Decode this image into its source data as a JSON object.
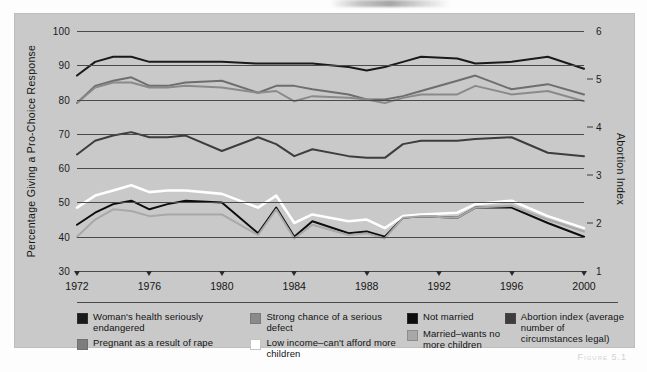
{
  "figure": {
    "caption": "Figure 5.1",
    "background_color": "#c9c9c9"
  },
  "chart_data": {
    "type": "line",
    "title": "",
    "xlabel": "",
    "ylabel": "Percentage  Giving a Pro-Choice Response",
    "y2label": "Abortion Index",
    "grid": true,
    "legend_position": "bottom",
    "xlim": [
      1972,
      2000
    ],
    "ylim": [
      30,
      100
    ],
    "y2lim": [
      1,
      6
    ],
    "yticks": [
      30,
      40,
      50,
      60,
      70,
      80,
      90,
      100
    ],
    "ytick_labels": [
      "30",
      "40",
      "50",
      "60",
      "70",
      "80",
      "90",
      "100"
    ],
    "y2ticks": [
      1,
      2,
      3,
      4,
      5,
      6
    ],
    "y2tick_labels": [
      "1",
      "2",
      "3",
      "4",
      "5",
      "6"
    ],
    "xticks": [
      1972,
      1976,
      1980,
      1984,
      1988,
      1992,
      1996,
      2000
    ],
    "xtick_labels": [
      "1972",
      "1976",
      "1980",
      "1984",
      "1988",
      "1992",
      "1996",
      "2000"
    ],
    "x": [
      1972,
      1973,
      1974,
      1975,
      1976,
      1977,
      1978,
      1980,
      1982,
      1983,
      1984,
      1985,
      1987,
      1988,
      1989,
      1990,
      1991,
      1993,
      1994,
      1996,
      1998,
      2000
    ],
    "series": [
      {
        "name": "Woman's health seriously endangered",
        "color": "#1a1a1a",
        "axis": "left",
        "values": [
          87,
          91,
          92.5,
          92.5,
          91,
          91,
          91,
          91,
          90.5,
          90.5,
          90.5,
          90.5,
          89.5,
          88.5,
          89.5,
          91,
          92.5,
          92,
          90.5,
          91,
          92.5,
          89
        ]
      },
      {
        "name": "Pregnant as a result of rape",
        "color": "#6e6e6e",
        "axis": "left",
        "values": [
          79,
          84,
          85.5,
          86.5,
          84,
          84,
          85,
          85.5,
          82,
          84,
          84,
          83,
          81.5,
          80,
          80,
          81,
          82.5,
          85.5,
          87,
          83,
          84.5,
          81.5
        ]
      },
      {
        "name": "Strong chance of a serious defect",
        "color": "#8a8a8a",
        "axis": "left",
        "values": [
          79,
          83.5,
          85,
          85,
          83.5,
          83.5,
          84,
          83.5,
          82,
          82.5,
          79.5,
          81,
          80.5,
          80,
          79,
          80.5,
          81.5,
          81.5,
          84,
          81.5,
          82.5,
          79.5
        ]
      },
      {
        "name": "Not married",
        "color": "#0d0d0d",
        "axis": "left",
        "values": [
          43.5,
          47,
          49.5,
          50.5,
          48,
          49.5,
          50.5,
          50,
          41,
          48.5,
          40,
          44.5,
          41,
          41.5,
          40,
          45.5,
          46,
          45.5,
          48.5,
          48.5,
          44,
          40
        ]
      },
      {
        "name": "Low income–can't afford more children",
        "color": "#ffffff",
        "axis": "left",
        "values": [
          48.5,
          52,
          53.5,
          55,
          53,
          53.5,
          53.5,
          52.5,
          48.5,
          52,
          44,
          46.5,
          44.5,
          45,
          42.5,
          46,
          46.5,
          47,
          49.5,
          50.5,
          46,
          42.5
        ]
      },
      {
        "name": "Married–wants no more children",
        "color": "#a8a8a8",
        "axis": "left",
        "values": [
          40,
          45,
          48,
          47.5,
          46,
          46.5,
          46.5,
          46.5,
          40.5,
          48,
          39.5,
          43.5,
          40.5,
          41,
          39.5,
          45.5,
          46,
          45.5,
          48.5,
          49,
          45,
          41.5
        ]
      },
      {
        "name": "Abortion index (average number of circumstances legal)",
        "color": "#3d3d3d",
        "axis": "right",
        "values_left_scale": [
          64,
          68,
          69.5,
          70.5,
          69,
          69,
          69.5,
          65,
          69,
          67,
          63.5,
          65.5,
          63.5,
          63,
          63,
          67,
          68,
          68,
          68.5,
          69,
          64.5,
          63.5
        ],
        "values": [
          3.43,
          3.71,
          3.82,
          3.89,
          3.79,
          3.79,
          3.82,
          3.5,
          3.79,
          3.64,
          3.39,
          3.54,
          3.39,
          3.36,
          3.36,
          3.64,
          3.71,
          3.71,
          3.75,
          3.79,
          3.46,
          3.39
        ]
      }
    ]
  },
  "legend": {
    "columns": [
      {
        "items": [
          {
            "label": "Woman's health seriously endangered",
            "color": "#1a1a1a"
          },
          {
            "label": "Pregnant as a result of rape",
            "color": "#7d7d7d"
          }
        ]
      },
      {
        "items": [
          {
            "label": "Strong chance of a serious defect",
            "color": "#8a8a8a"
          },
          {
            "label": "Low income–can't afford more children",
            "color": "#ffffff"
          }
        ]
      },
      {
        "items": [
          {
            "label": "Not married",
            "color": "#0d0d0d"
          },
          {
            "label": "Married–wants no more children",
            "color": "#a8a8a8"
          }
        ]
      },
      {
        "items": [
          {
            "label": "Abortion index (average number of circumstances legal)",
            "color": "#3d3d3d"
          }
        ]
      }
    ]
  }
}
